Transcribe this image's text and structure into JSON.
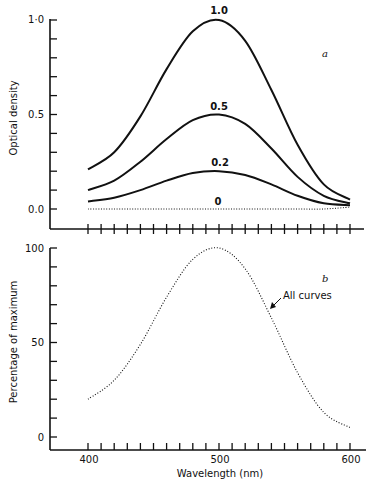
{
  "chart_data": [
    {
      "panel": "a",
      "type": "line",
      "title": "",
      "xlabel": "",
      "ylabel": "Optical density",
      "xlim": [
        400,
        600
      ],
      "ylim": [
        0.0,
        1.0
      ],
      "ytick_labels": [
        "0.0",
        "0.5",
        "1·0"
      ],
      "x_tick_interval": 10,
      "x": [
        400,
        420,
        440,
        460,
        480,
        500,
        520,
        540,
        560,
        580,
        600
      ],
      "series": [
        {
          "name": "1.0",
          "style": "solid",
          "values": [
            0.21,
            0.3,
            0.49,
            0.74,
            0.94,
            1.0,
            0.89,
            0.63,
            0.34,
            0.13,
            0.05
          ]
        },
        {
          "name": "0.5",
          "style": "solid",
          "values": [
            0.1,
            0.15,
            0.25,
            0.37,
            0.47,
            0.5,
            0.45,
            0.32,
            0.17,
            0.07,
            0.03
          ]
        },
        {
          "name": "0.2",
          "style": "solid",
          "values": [
            0.04,
            0.06,
            0.1,
            0.15,
            0.19,
            0.2,
            0.18,
            0.13,
            0.07,
            0.03,
            0.02
          ]
        },
        {
          "name": "0",
          "style": "dotted",
          "values": [
            0.0,
            0.0,
            0.0,
            0.0,
            0.0,
            0.0,
            0.0,
            0.0,
            0.0,
            0.0,
            0.01
          ]
        }
      ],
      "annotations": [
        "a"
      ]
    },
    {
      "panel": "b",
      "type": "line",
      "title": "",
      "xlabel": "Wavelength (nm)",
      "ylabel": "Percentage of maximum",
      "xlim": [
        400,
        600
      ],
      "ylim": [
        0,
        100
      ],
      "xtick_labels": [
        "400",
        "500",
        "600"
      ],
      "ytick_labels": [
        "0",
        "50",
        "100"
      ],
      "x_tick_interval": 10,
      "x": [
        400,
        420,
        440,
        460,
        480,
        500,
        520,
        540,
        560,
        580,
        600
      ],
      "series": [
        {
          "name": "All curves",
          "style": "dotted",
          "values": [
            20,
            30,
            49,
            74,
            94,
            100,
            89,
            63,
            34,
            13,
            5
          ]
        }
      ],
      "annotations": [
        "b",
        "All curves"
      ]
    }
  ],
  "panel_a": {
    "ylabel": "Optical density",
    "yticks": [
      "1·0",
      "0.5",
      "0.0"
    ],
    "curve_labels": [
      "1.0",
      "0.5",
      "0.2",
      "0"
    ],
    "letter": "a"
  },
  "panel_b": {
    "ylabel": "Percentage of maximum",
    "yticks": [
      "100",
      "50",
      "0"
    ],
    "xticks": [
      "400",
      "500",
      "600"
    ],
    "xlabel": "Wavelength (nm)",
    "annotation": "All curves",
    "letter": "b"
  }
}
